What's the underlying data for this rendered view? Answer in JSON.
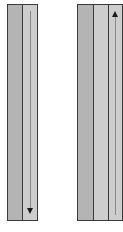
{
  "diagram": {
    "left_column": {
      "strips": [
        {
          "shade": "dark",
          "color": "#b4b4b4"
        },
        {
          "shade": "light",
          "color": "#cdcdcd",
          "arrow": "down-arrow"
        }
      ]
    },
    "right_column": {
      "strips": [
        {
          "shade": "dark",
          "color": "#b4b4b4"
        },
        {
          "shade": "light",
          "color": "#cdcdcd"
        },
        {
          "shade": "light",
          "color": "#cdcdcd",
          "arrow": "up-arrow"
        }
      ]
    },
    "border_color": "#3a3a3a",
    "arrow_color": "#1a1a1a"
  }
}
